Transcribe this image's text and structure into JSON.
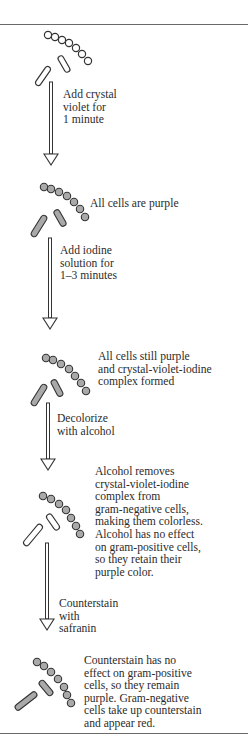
{
  "diagram": {
    "colors": {
      "stained_cell_fill": "#a9a9a9",
      "unstained_cell_fill": "#ffffff",
      "outline": "#333333",
      "rule": "#6a6a6a"
    },
    "stages": [
      {
        "id": "unstained",
        "cocci_stained": false,
        "bacilli_stained": false,
        "caption": ""
      },
      {
        "id": "crystal-violet",
        "cocci_stained": true,
        "bacilli_stained": true,
        "caption": "All cells are purple"
      },
      {
        "id": "iodine",
        "cocci_stained": true,
        "bacilli_stained": true,
        "caption": "All cells still purple\nand crystal-violet-iodine\ncomplex formed"
      },
      {
        "id": "decolorized",
        "cocci_stained": true,
        "bacilli_stained": false,
        "caption": "Alcohol removes\ncrystal-violet-iodine\ncomplex from\ngram-negative cells,\nmaking them colorless.\nAlcohol has no effect\non gram-positive cells,\nso they retain their\npurple color."
      },
      {
        "id": "counterstained",
        "cocci_stained": true,
        "bacilli_stained": true,
        "caption": "Counterstain has no\neffect on gram-positive\ncells, so they remain\npurple. Gram-negative\ncells take up counterstain\nand appear red."
      }
    ],
    "steps": [
      {
        "label": "Add crystal\nviolet for\n1 minute"
      },
      {
        "label": "Add iodine\nsolution for\n1–3 minutes"
      },
      {
        "label": "Decolorize\nwith alcohol"
      },
      {
        "label": "Counterstain\nwith\nsafranin"
      }
    ]
  }
}
